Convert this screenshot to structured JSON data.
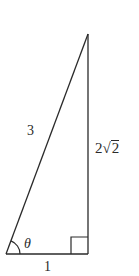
{
  "figure": {
    "type": "right-triangle",
    "stroke_color": "#2a2a2a",
    "vertices": {
      "bottom_left": [
        6,
        254
      ],
      "bottom_right": [
        88,
        254
      ],
      "top": [
        88,
        34
      ]
    },
    "right_angle_marker": {
      "x": 71,
      "y": 237,
      "size": 17
    },
    "angle_arc": {
      "center": [
        6,
        254
      ],
      "radius": 14
    }
  },
  "labels": {
    "hypotenuse": "3",
    "vertical_coef": "2",
    "vertical_radical_sign": "√",
    "vertical_radicand": "2",
    "base": "1",
    "angle": "θ"
  }
}
